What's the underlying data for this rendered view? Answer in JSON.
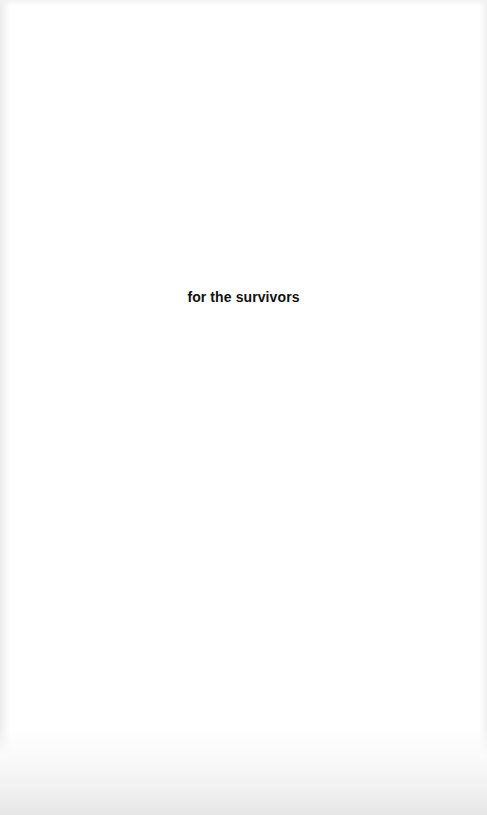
{
  "page": {
    "type": "dedication",
    "dedication_text": "for the survivors",
    "colors": {
      "background": "#ffffff",
      "text": "#111111",
      "edge_shading": "#e6e6e6"
    }
  }
}
